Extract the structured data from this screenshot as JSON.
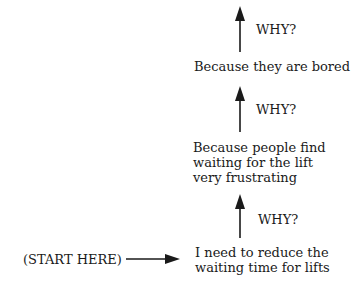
{
  "diagram": {
    "type": "five-whys",
    "start_label": "(START HERE)",
    "why_label": "WHY?",
    "steps": [
      {
        "lines": [
          "I need to reduce the",
          "waiting time for lifts"
        ]
      },
      {
        "lines": [
          "Because people find",
          "waiting for the lift",
          "very frustrating"
        ]
      },
      {
        "lines": [
          "Because they are bored"
        ]
      }
    ],
    "why_labels": [
      "WHY?",
      "WHY?",
      "WHY?"
    ]
  }
}
